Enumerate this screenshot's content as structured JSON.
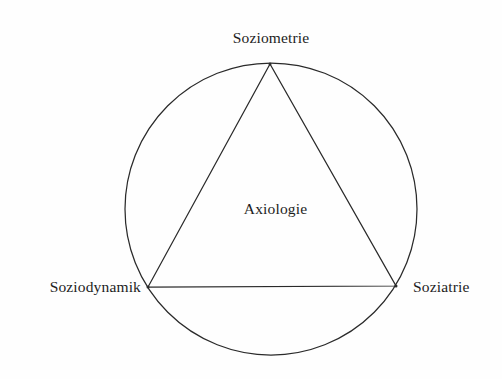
{
  "diagram": {
    "title": "Axiologie",
    "type": "triangle-in-circle",
    "background_color": "#fefefe",
    "stroke_color": "#2a2a2a",
    "text_color": "#1d1d1d",
    "circle": {
      "center_x": 271,
      "center_y": 209,
      "radius": 146
    },
    "vertices": [
      {
        "id": "top",
        "label": "Soziometrie",
        "x": 270,
        "y": 64
      },
      {
        "id": "left",
        "label": "Soziodynamik",
        "x": 148,
        "y": 287
      },
      {
        "id": "right",
        "label": "Soziatrie",
        "x": 396,
        "y": 286
      }
    ],
    "center_label": "Axiologie"
  }
}
